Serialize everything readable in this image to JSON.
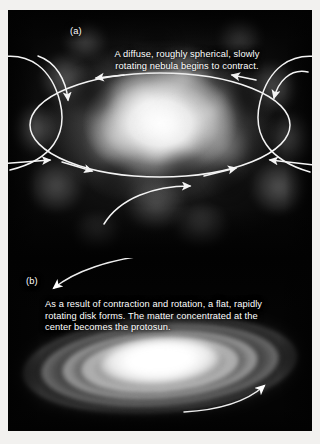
{
  "figure": {
    "panels": [
      {
        "id": "a",
        "label": "(a)",
        "caption": "A diffuse, roughly spherical, slowly\nrotating nebula begins to contract.",
        "subject": "solar-nebula",
        "annotations": {
          "rotation_ring": "ellipse with arrowheads indicating slow rotation",
          "inflow_arrows": "curved arrows pointing inward indicating contraction"
        }
      },
      {
        "id": "b",
        "label": "(b)",
        "caption": "As a result of contraction and rotation, a flat, rapidly\nrotating disk forms. The matter concentrated at the\ncenter becomes the protosun.",
        "subject": "protoplanetary-disk",
        "annotations": {
          "rotation_arrows": "two curved arrows showing rapid disk rotation"
        }
      }
    ],
    "colors": {
      "page_background": "#f2f1ef",
      "plate_background": "#050505",
      "caption_text": "#ffffff",
      "annotation_stroke": "#f4f4f4",
      "nebula_core": "#ffffff",
      "disk_core": "#ffffff"
    }
  }
}
